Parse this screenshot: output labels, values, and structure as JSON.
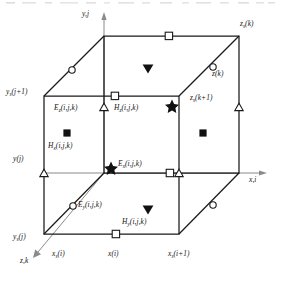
{
  "figure": {
    "type": "3d-cube-diagram",
    "line_color": "#1a1a1a",
    "axis_color": "#8a8a8a"
  },
  "axes": [
    {
      "name": "y-axis",
      "label": "y,j",
      "direction": "up"
    },
    {
      "name": "x-axis",
      "label": "x,i",
      "direction": "right"
    },
    {
      "name": "z-axis",
      "label": "z,k",
      "direction": "down-left"
    }
  ],
  "axis_labels": {
    "y": "y,j",
    "x": "x,i",
    "z": "z,k"
  },
  "coordinate_labels": [
    {
      "name": "ys-j-plus-1",
      "text": "y",
      "sub": "s",
      "rest": "(j+1)",
      "x": 6,
      "y": 92
    },
    {
      "name": "y-j",
      "text": "y",
      "sub": "",
      "rest": "(j)",
      "x": 12,
      "y": 158
    },
    {
      "name": "ys-j",
      "text": "y",
      "sub": "s",
      "rest": "(j)",
      "x": 13,
      "y": 237
    },
    {
      "name": "xs-i",
      "text": "x",
      "sub": "s",
      "rest": "(i)",
      "x": 55,
      "y": 253
    },
    {
      "name": "x-i",
      "text": "x",
      "sub": "",
      "rest": "(i)",
      "x": 112,
      "y": 253
    },
    {
      "name": "xs-i-plus-1",
      "text": "x",
      "sub": "s",
      "rest": "(i+1)",
      "x": 173,
      "y": 253
    },
    {
      "name": "zs-k",
      "text": "z",
      "sub": "s",
      "rest": "(k)",
      "x": 238,
      "y": 23
    },
    {
      "name": "z-k",
      "text": "z",
      "sub": "",
      "rest": "(k)",
      "x": 212,
      "y": 72
    },
    {
      "name": "zs-k-plus-1",
      "text": "z",
      "sub": "s",
      "rest": "(k+1)",
      "x": 194,
      "y": 96
    }
  ],
  "field_labels": [
    {
      "name": "Ez-label",
      "sym": "E",
      "sub": "z",
      "rest": "(i,j,k)",
      "x": 57,
      "y": 100
    },
    {
      "name": "Hz-label",
      "sym": "H",
      "sub": "z",
      "rest": "(i,j,k)",
      "x": 117,
      "y": 100
    },
    {
      "name": "Hx-label",
      "sym": "H",
      "sub": "x",
      "rest": "(i,j,k)",
      "x": 36,
      "y": 141
    },
    {
      "name": "Ex-label",
      "sym": "E",
      "sub": "x",
      "rest": "(i,j,k)",
      "x": 118,
      "y": 160
    },
    {
      "name": "Ey-label",
      "sym": "E",
      "sub": "y",
      "rest": "(i,j,k)",
      "x": 72,
      "y": 201
    },
    {
      "name": "Hy-label",
      "sym": "H",
      "sub": "y",
      "rest": "(i,j,k)",
      "x": 114,
      "y": 219
    }
  ],
  "markers": {
    "legend": {
      "circle": "Ey component node",
      "triangle": "Ez component node",
      "square_open": "x(i) / Hz node",
      "square_filled": "Hx component",
      "triangle_down_filled": "Hy component",
      "star_filled": "Ex component"
    },
    "open_circle": [
      {
        "x": 72,
        "y": 70
      },
      {
        "x": 213,
        "y": 67
      },
      {
        "x": 73,
        "y": 206
      },
      {
        "x": 213,
        "y": 205
      }
    ],
    "open_square": [
      {
        "x": 169,
        "y": 36
      },
      {
        "x": 115,
        "y": 96
      },
      {
        "x": 170,
        "y": 173
      },
      {
        "x": 116,
        "y": 234
      }
    ],
    "open_triangle": [
      {
        "x": 104,
        "y": 107
      },
      {
        "x": 239,
        "y": 107
      },
      {
        "x": 44,
        "y": 173
      },
      {
        "x": 179,
        "y": 173
      }
    ],
    "filled_triangle_down": [
      {
        "x": 148,
        "y": 68
      },
      {
        "x": 148,
        "y": 209
      }
    ],
    "filled_square": [
      {
        "x": 67,
        "y": 133
      },
      {
        "x": 203,
        "y": 133
      }
    ],
    "filled_star": [
      {
        "x": 172,
        "y": 105
      },
      {
        "x": 111,
        "y": 167
      }
    ]
  },
  "cube_geometry": {
    "front_face": [
      [
        44,
        96
      ],
      [
        179,
        96
      ],
      [
        179,
        234
      ],
      [
        44,
        234
      ]
    ],
    "back_face": [
      [
        104,
        36
      ],
      [
        239,
        36
      ],
      [
        239,
        173
      ],
      [
        104,
        173
      ]
    ],
    "connectors": [
      [
        44,
        96,
        104,
        36
      ],
      [
        179,
        96,
        239,
        36
      ],
      [
        179,
        234,
        239,
        173
      ],
      [
        44,
        234,
        104,
        173
      ]
    ]
  }
}
